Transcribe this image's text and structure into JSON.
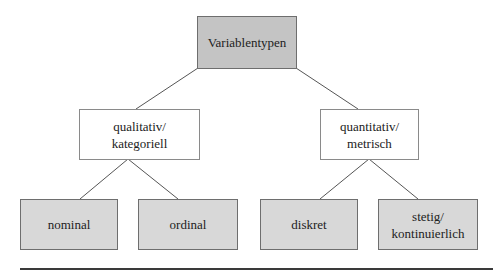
{
  "diagram": {
    "root": {
      "label": "Variablentypen"
    },
    "level1": [
      {
        "label": "qualitativ/\nkategoriell"
      },
      {
        "label": "quantitativ/\nmetrisch"
      }
    ],
    "level2": [
      {
        "label": "nominal"
      },
      {
        "label": "ordinal"
      },
      {
        "label": "diskret"
      },
      {
        "label": "stetig/\nkontinuierlich"
      }
    ],
    "colors": {
      "root_fill": "#c4c4c4",
      "mid_fill": "#ffffff",
      "leaf_fill": "#d8d8d8",
      "border": "#6e6e6e",
      "connector": "#555555"
    }
  }
}
